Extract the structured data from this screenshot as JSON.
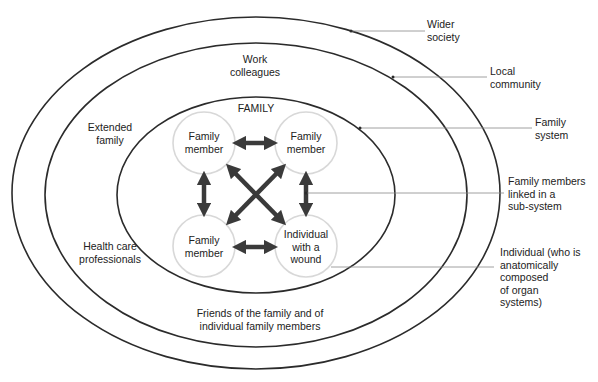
{
  "title": "FAMILY",
  "colors": {
    "line": "#2b2b2b",
    "circle": "#d8d8d8",
    "arrow": "#3a3a3a",
    "leader": "#888888"
  },
  "ellipses": [
    {
      "name": "wider-society",
      "cx": 256,
      "cy": 193,
      "rx": 244,
      "ry": 176
    },
    {
      "name": "local-community",
      "cx": 256,
      "cy": 195,
      "rx": 211,
      "ry": 152
    },
    {
      "name": "family-system",
      "cx": 256,
      "cy": 195,
      "rx": 139,
      "ry": 98
    }
  ],
  "zone_labels": {
    "work_colleagues": [
      "Work",
      "colleagues"
    ],
    "extended_family": [
      "Extended",
      "family"
    ],
    "health_care": [
      "Health care",
      "professionals"
    ],
    "friends": [
      "Friends of the family and of",
      "individual family members"
    ]
  },
  "nodes": [
    {
      "id": "top-left",
      "lines": [
        "Family",
        "member"
      ]
    },
    {
      "id": "top-right",
      "lines": [
        "Family",
        "member"
      ]
    },
    {
      "id": "bottom-left",
      "lines": [
        "Family",
        "member"
      ]
    },
    {
      "id": "bottom-right",
      "lines": [
        "Individual",
        "with a",
        "wound"
      ]
    }
  ],
  "annotations": {
    "wider_society": [
      "Wider",
      "society"
    ],
    "local_community": [
      "Local",
      "community"
    ],
    "family_system": [
      "Family",
      "system"
    ],
    "sub_system": [
      "Family members",
      "linked in a",
      "sub-system"
    ],
    "individual": [
      "Individual (who is",
      "anatomically",
      "composed",
      "of organ",
      "systems)"
    ]
  }
}
